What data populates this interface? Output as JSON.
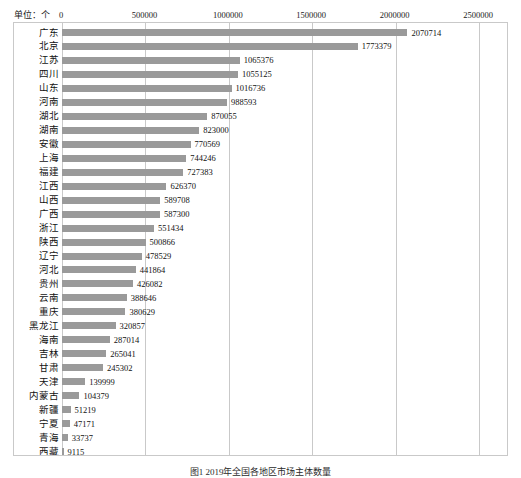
{
  "unit_label": "单位：个",
  "caption": "图1  2019年全国各地区市场主体数量",
  "colors": {
    "bar": "#9a9a9a",
    "gridline": "#c9c9c9",
    "frame": "#c9c9c9",
    "text": "#111111",
    "background": "#ffffff"
  },
  "chart_data": {
    "type": "bar",
    "orientation": "horizontal",
    "title": "",
    "subtitle": "",
    "xlabel": "单位：个",
    "ylabel": "",
    "xlim": [
      0,
      2500000
    ],
    "xticks": [
      0,
      500000,
      1000000,
      1500000,
      2000000,
      2500000
    ],
    "xtick_labels": [
      "0",
      "500000",
      "1000000",
      "1500000",
      "2000000",
      "2500000"
    ],
    "grid": true,
    "legend": false,
    "value_labels": true,
    "categories": [
      "广东",
      "北京",
      "江苏",
      "四川",
      "山东",
      "河南",
      "湖北",
      "湖南",
      "安徽",
      "上海",
      "福建",
      "江西",
      "山西",
      "广西",
      "浙江",
      "陕西",
      "辽宁",
      "河北",
      "贵州",
      "云南",
      "重庆",
      "黑龙江",
      "海南",
      "吉林",
      "甘肃",
      "天津",
      "内蒙古",
      "新疆",
      "宁夏",
      "青海",
      "西藏"
    ],
    "values": [
      2070714,
      1773379,
      1065376,
      1055125,
      1016736,
      988593,
      870055,
      823000,
      770569,
      744246,
      727383,
      626370,
      589708,
      587300,
      551434,
      500866,
      478529,
      441864,
      426082,
      388646,
      380629,
      320857,
      287014,
      265041,
      245302,
      139999,
      104379,
      51219,
      47171,
      33737,
      9115
    ],
    "value_texts": [
      "2070714",
      "1773379",
      "1065376",
      "1055125",
      "1016736",
      "988593",
      "870055",
      "823000",
      "770569",
      "744246",
      "727383",
      "626370",
      "589708",
      "587300",
      "551434",
      "500866",
      "478529",
      "441864",
      "426082",
      "388646",
      "380629",
      "320857",
      "287014",
      "265041",
      "245302",
      "139999",
      "104379",
      "51219",
      "47171",
      "33737",
      "9115"
    ]
  }
}
